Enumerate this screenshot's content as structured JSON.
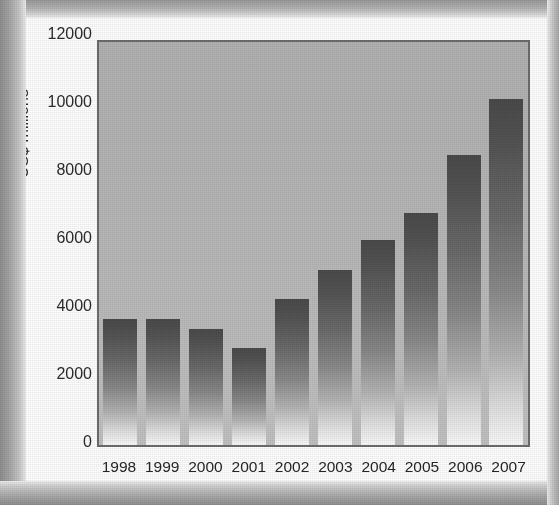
{
  "figure": {
    "caption": "Figure 7. World trade in ...",
    "caption_visible_note": "cropped at top edge"
  },
  "chart_data": {
    "type": "bar",
    "title": "",
    "xlabel": "",
    "ylabel": "US$ millions",
    "categories": [
      "1998",
      "1999",
      "2000",
      "2001",
      "2002",
      "2003",
      "2004",
      "2005",
      "2006",
      "2007"
    ],
    "values": [
      3750,
      3750,
      3450,
      2900,
      4350,
      5200,
      6100,
      6900,
      8650,
      10300
    ],
    "ylim": [
      0,
      12000
    ],
    "yticks": [
      12000,
      10000,
      8000,
      6000,
      4000,
      2000,
      0
    ],
    "ytick_labels": [
      "12000",
      "10000",
      "8000",
      "6000",
      "4000",
      "2000",
      "0"
    ],
    "grid": false,
    "legend": null,
    "legend_position": "none",
    "series": [
      {
        "name": "World trade",
        "values": [
          3750,
          3750,
          3450,
          2900,
          4350,
          5200,
          6100,
          6900,
          8650,
          10300
        ]
      }
    ],
    "bar_style": {
      "fill": "vertical-gradient",
      "gradient_top_color": "#4a4a4a",
      "gradient_bottom_color": "#fbfbfb"
    },
    "plot_background": "#b8b8b8",
    "plot_border_color": "#6d6d6d",
    "axis_text_color": "#2b2b2b"
  }
}
